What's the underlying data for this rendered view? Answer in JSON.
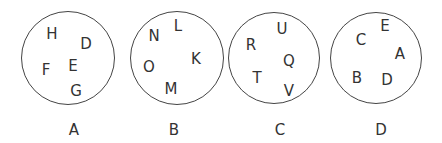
{
  "diagram": {
    "sets": [
      {
        "label": "A",
        "cx": 68,
        "cy": 58,
        "r": 47,
        "label_pos": [
          74,
          130
        ],
        "letters": [
          {
            "t": "H",
            "x": 52,
            "y": 34
          },
          {
            "t": "D",
            "x": 86,
            "y": 44
          },
          {
            "t": "F",
            "x": 46,
            "y": 70
          },
          {
            "t": "E",
            "x": 73,
            "y": 66
          },
          {
            "t": "G",
            "x": 76,
            "y": 91
          }
        ]
      },
      {
        "label": "B",
        "cx": 177,
        "cy": 58,
        "r": 47,
        "label_pos": [
          174,
          130
        ],
        "letters": [
          {
            "t": "N",
            "x": 154,
            "y": 36
          },
          {
            "t": "L",
            "x": 178,
            "y": 26
          },
          {
            "t": "K",
            "x": 196,
            "y": 59
          },
          {
            "t": "O",
            "x": 149,
            "y": 67
          },
          {
            "t": "M",
            "x": 171,
            "y": 89
          }
        ]
      },
      {
        "label": "C",
        "cx": 274,
        "cy": 58,
        "r": 46,
        "label_pos": [
          280,
          130
        ],
        "letters": [
          {
            "t": "U",
            "x": 282,
            "y": 29
          },
          {
            "t": "R",
            "x": 251,
            "y": 45
          },
          {
            "t": "Q",
            "x": 289,
            "y": 61
          },
          {
            "t": "T",
            "x": 257,
            "y": 78
          },
          {
            "t": "V",
            "x": 289,
            "y": 91
          }
        ]
      },
      {
        "label": "D",
        "cx": 376,
        "cy": 58,
        "r": 46,
        "label_pos": [
          381,
          130
        ],
        "letters": [
          {
            "t": "E",
            "x": 385,
            "y": 26
          },
          {
            "t": "C",
            "x": 361,
            "y": 40
          },
          {
            "t": "A",
            "x": 400,
            "y": 54
          },
          {
            "t": "B",
            "x": 357,
            "y": 78
          },
          {
            "t": "D",
            "x": 387,
            "y": 80
          }
        ]
      }
    ]
  }
}
